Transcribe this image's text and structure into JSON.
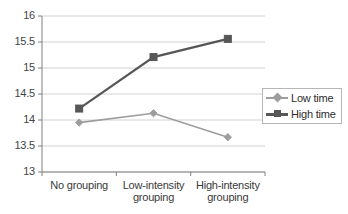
{
  "chart_data": {
    "type": "line",
    "title": "",
    "xlabel": "",
    "ylabel": "",
    "categories": [
      "No grouping",
      "Low-intensity grouping",
      "High-intensity grouping"
    ],
    "series": [
      {
        "name": "Low time",
        "values": [
          13.95,
          14.13,
          13.67
        ],
        "color": "#9d9d9d",
        "marker": "diamond"
      },
      {
        "name": "High time",
        "values": [
          14.22,
          15.21,
          15.56
        ],
        "color": "#575757",
        "marker": "square"
      }
    ],
    "ylim": [
      13,
      16
    ],
    "yticks": [
      "13",
      "13.5",
      "14",
      "14.5",
      "15",
      "15.5",
      "16"
    ],
    "ytick_values": [
      13,
      13.5,
      14,
      14.5,
      15,
      15.5,
      16
    ],
    "grid": true,
    "legend_position": "right"
  },
  "legend": {
    "entries": [
      {
        "label": "Low time"
      },
      {
        "label": "High time"
      }
    ]
  },
  "colors": {
    "low_time": "#9d9d9d",
    "high_time": "#575757",
    "grid": "#d2d2d2",
    "axis": "#808080",
    "text": "#3a3a3a"
  }
}
